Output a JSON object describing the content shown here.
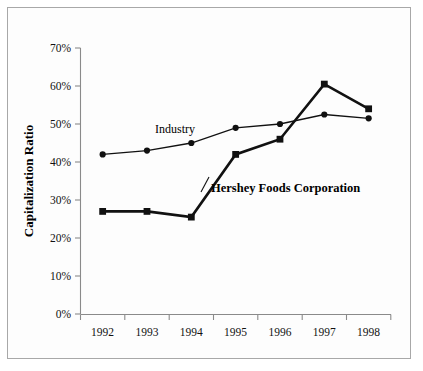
{
  "chart_data": {
    "type": "line",
    "title": "",
    "xlabel": "",
    "ylabel": "Capitalization Ratio",
    "categories": [
      "1992",
      "1993",
      "1994",
      "1995",
      "1996",
      "1997",
      "1998"
    ],
    "ylim": [
      0,
      70
    ],
    "ytick_labels": [
      "0%",
      "10%",
      "20%",
      "30%",
      "40%",
      "50%",
      "60%",
      "70%"
    ],
    "ytick_values": [
      0,
      10,
      20,
      30,
      40,
      50,
      60,
      70
    ],
    "grid": false,
    "legend_position": "inline-annotations",
    "series": [
      {
        "name": "Industry",
        "marker": "circle",
        "values": [
          42,
          43,
          45,
          49,
          50,
          52.5,
          51.5
        ]
      },
      {
        "name": "Hershey Foods Corporation",
        "marker": "square",
        "values": [
          27,
          27,
          25.5,
          42,
          46,
          60.5,
          54
        ]
      }
    ],
    "annotations": [
      {
        "text": "Industry",
        "series": "Industry"
      },
      {
        "text": "Hershey Foods Corporation",
        "series": "Hershey Foods Corporation"
      }
    ],
    "colors": {
      "line": "#111111",
      "axis": "#8a8a8a",
      "border": "#a8a8a8",
      "background": "#ffffff"
    }
  }
}
